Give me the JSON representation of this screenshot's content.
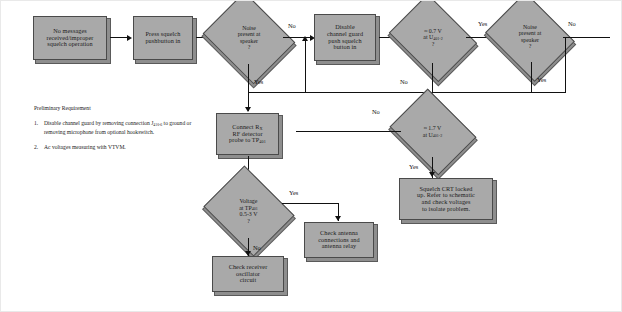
{
  "diagram": {
    "colors": {
      "node_fill": "#a9a9a9",
      "node_border": "#4a4a4a",
      "shadow": "#8e8e8e",
      "line": "#111111",
      "page_background": "#ffffff"
    }
  },
  "nodes": {
    "start": {
      "type": "process",
      "lines": [
        "No messages",
        "received/improper",
        "squelch operation"
      ]
    },
    "press_squelch": {
      "type": "process",
      "lines": [
        "Press squelch",
        "pushbutton in"
      ]
    },
    "noise_1": {
      "type": "decision",
      "lines": [
        "Noise",
        "present at",
        "speaker",
        "?"
      ]
    },
    "disable_guard": {
      "type": "process",
      "lines": [
        "Disable",
        "channel guard",
        "push squelch",
        "button in"
      ]
    },
    "v_07": {
      "type": "decision",
      "lines": [
        "≈ 0.7 V",
        "at U",
        "?"
      ],
      "subscript": "401-2"
    },
    "noise_2": {
      "type": "decision",
      "lines": [
        "Noise",
        "present at",
        "speaker",
        "?"
      ]
    },
    "v_17": {
      "type": "decision",
      "lines": [
        "≈ 1.7 V",
        "at U"
      ],
      "subscript": "401-2"
    },
    "connect_probe": {
      "type": "process",
      "lines": [
        "Connect R",
        "RF detector",
        "probe to TP"
      ],
      "sub_rx": "X",
      "sub_tp": "401"
    },
    "voltage_tp": {
      "type": "decision",
      "lines": [
        "Voltage",
        "at TP",
        "0.5-3 V",
        "?"
      ],
      "subscript": "401"
    },
    "squelch_crt": {
      "type": "process",
      "lines": [
        "Squelch CRT locked",
        "up. Refer to schematic",
        "and check voltages",
        "to isolate problem."
      ]
    },
    "check_antenna": {
      "type": "process",
      "lines": [
        "Check antenna",
        "connections and",
        "antenna relay"
      ]
    },
    "check_receiver": {
      "type": "process",
      "lines": [
        "Check receiver",
        "oscillator",
        "circuit"
      ]
    }
  },
  "edge_labels": {
    "noise1_no": "No",
    "noise1_yes": "Yes",
    "v07_yes": "Yes",
    "v07_no": "No",
    "noise2_no": "No",
    "noise2_yes": "Yes",
    "v17_no": "No",
    "v17_yes": "Yes",
    "voltage_yes": "Yes",
    "voltage_no": "No"
  },
  "note": {
    "title": "Preliminary Requirement",
    "items": [
      {
        "num": "1.",
        "text_before": "Disable channel guard by removing connection J",
        "subscript": "410-6",
        "text_after": " to ground or removing microphone from optional hookswitch."
      },
      {
        "num": "2.",
        "text_before": "Ac voltages measuring with VTVM.",
        "subscript": "",
        "text_after": ""
      }
    ]
  }
}
